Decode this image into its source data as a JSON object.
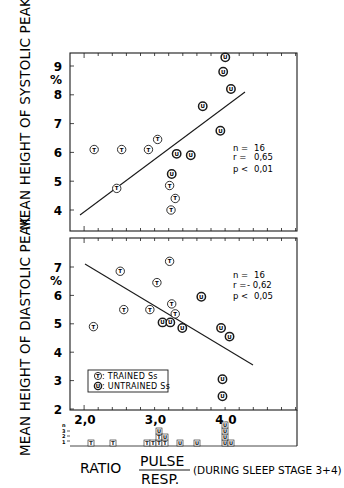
{
  "chart_data": [
    {
      "type": "scatter",
      "panel": "upper",
      "title": "",
      "ylabel": "MEAN HEIGHT OF SYSTOLIC PEAK",
      "yunit": "%",
      "xlabel": "RATIO PULSE/RESP. (DURING SLEEP STAGE 3+4)",
      "ylim": [
        3.3,
        9.6
      ],
      "xlim": [
        1.8,
        5.0
      ],
      "yticks": [
        "4",
        "5",
        "6",
        "7",
        "8",
        "9"
      ],
      "grid": false,
      "stats": {
        "n_label": "n =",
        "n": "16",
        "r_label": "r =",
        "r": "0,65",
        "p_label": "p  <",
        "p": "0,01"
      },
      "regression": {
        "x": [
          2.0,
          4.85
        ],
        "y": [
          3.8,
          8.1
        ]
      },
      "series": [
        {
          "name": "TRAINED Ss",
          "marker": "T",
          "points": [
            [
              2.13,
              6.1
            ],
            [
              2.52,
              6.1
            ],
            [
              2.9,
              6.1
            ],
            [
              3.03,
              6.45
            ],
            [
              2.45,
              4.75
            ],
            [
              3.2,
              4.85
            ],
            [
              3.28,
              4.4
            ],
            [
              3.22,
              4.0
            ]
          ]
        },
        {
          "name": "UNTRAINED Ss",
          "marker": "U",
          "points": [
            [
              3.23,
              5.25
            ],
            [
              3.3,
              5.95
            ],
            [
              3.5,
              5.9
            ],
            [
              3.67,
              7.6
            ],
            [
              3.92,
              6.75
            ],
            [
              4.07,
              8.2
            ],
            [
              3.96,
              8.8
            ],
            [
              3.99,
              9.3
            ]
          ]
        }
      ]
    },
    {
      "type": "scatter",
      "panel": "lower",
      "title": "",
      "ylabel": "MEAN HEIGHT OF DIASTOLIC PEAK",
      "yunit": "%",
      "ylim": [
        2.0,
        8.0
      ],
      "xlim": [
        1.8,
        5.0
      ],
      "yticks": [
        "2",
        "3",
        "4",
        "5",
        "6",
        "7"
      ],
      "xticks": [
        "2,0",
        "3,0",
        "4,0"
      ],
      "grid": false,
      "stats": {
        "n_label": "n =",
        "n": "16",
        "r_label": "r =",
        "r": "- 0,62",
        "p_label": "p <",
        "p": "0,05"
      },
      "regression": {
        "x": [
          2.0,
          5.0
        ],
        "y": [
          7.1,
          3.6
        ]
      },
      "series": [
        {
          "name": "TRAINED Ss",
          "marker": "T",
          "points": [
            [
              2.12,
              4.9
            ],
            [
              2.5,
              6.85
            ],
            [
              2.55,
              5.5
            ],
            [
              2.92,
              5.5
            ],
            [
              3.02,
              6.45
            ],
            [
              3.2,
              7.2
            ],
            [
              3.23,
              5.7
            ],
            [
              3.28,
              5.35
            ]
          ]
        },
        {
          "name": "UNTRAINED Ss",
          "marker": "U",
          "points": [
            [
              3.1,
              5.05
            ],
            [
              3.21,
              5.05
            ],
            [
              3.38,
              4.85
            ],
            [
              3.65,
              5.95
            ],
            [
              3.93,
              4.85
            ],
            [
              4.05,
              4.55
            ],
            [
              3.95,
              3.05
            ],
            [
              3.95,
              2.45
            ]
          ]
        }
      ]
    },
    {
      "type": "bar",
      "panel": "histogram",
      "ylabel": "n",
      "yticks": [
        "1",
        "2",
        "3"
      ],
      "stacks": [
        {
          "x": 2.1,
          "items": [
            "T"
          ]
        },
        {
          "x": 2.4,
          "items": [
            "T"
          ]
        },
        {
          "x": 2.9,
          "items": [
            "T"
          ]
        },
        {
          "x": 3.0,
          "items": [
            "T"
          ]
        },
        {
          "x": 3.1,
          "items": [
            "T",
            "T",
            "U"
          ]
        },
        {
          "x": 3.2,
          "items": [
            "T",
            "U"
          ]
        },
        {
          "x": 3.4,
          "items": [
            "U"
          ]
        },
        {
          "x": 3.6,
          "items": [
            "U"
          ]
        },
        {
          "x": 3.9,
          "items": [
            "U",
            "U",
            "U",
            "U"
          ]
        },
        {
          "x": 4.0,
          "items": [
            "U"
          ]
        }
      ]
    }
  ],
  "legend": {
    "trained": {
      "symbol": "T",
      "label": ": TRAINED Ss"
    },
    "untrained": {
      "symbol": "U",
      "label": ": UNTRAINED Ss"
    }
  },
  "xaxis": {
    "prefix": "RATIO",
    "numerator": "PULSE",
    "denominator": "RESP.",
    "suffix": "(DURING SLEEP STAGE 3+4)"
  },
  "labels": {
    "percent": "%",
    "hist_n": "n",
    "hist_ticks": [
      "3",
      "2",
      "1"
    ]
  },
  "colors": {
    "ink": "#1a1a1a",
    "background": "#ffffff"
  }
}
